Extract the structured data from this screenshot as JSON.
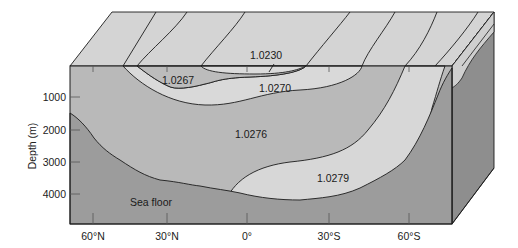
{
  "figure": {
    "type": "ocean-density-cross-section-block-diagram",
    "y_axis": {
      "title": "Depth (m)",
      "ticks": [
        "1000",
        "2000",
        "3000",
        "4000"
      ]
    },
    "x_axis": {
      "ticks": [
        "60°N",
        "30°N",
        "0°",
        "30°S",
        "60°S"
      ]
    },
    "density_labels": {
      "surface": "1.0230",
      "north_shallow": "1.0267",
      "intermediate": "1.0270",
      "deep": "1.0276",
      "bottom": "1.0279"
    },
    "sea_floor_label": "Sea floor",
    "colors": {
      "top_face": "#d4d4d4",
      "water_light": "#d9d9d9",
      "water_mid": "#b9b9b9",
      "sea_floor": "#9c9c9c",
      "side_face": "#8e8e8e",
      "line": "#1c1c1c"
    }
  }
}
